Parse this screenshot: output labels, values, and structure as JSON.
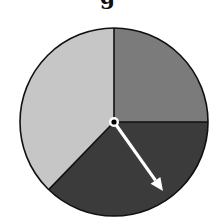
{
  "title_fragment": "g",
  "spinner": {
    "center": [
      114,
      122
    ],
    "radius": 94,
    "sectors": [
      {
        "name": "upper-right",
        "start_deg": 270,
        "end_deg": 360,
        "color": "#7b7b7b"
      },
      {
        "name": "bottom",
        "start_deg": 0,
        "end_deg": 134,
        "color": "#3b3b3b"
      },
      {
        "name": "left",
        "start_deg": 134,
        "end_deg": 270,
        "color": "#c6c6c6"
      }
    ],
    "arrow": {
      "tip": [
        163,
        191
      ],
      "color": "#ffffff"
    },
    "outline_color": "#111111"
  }
}
